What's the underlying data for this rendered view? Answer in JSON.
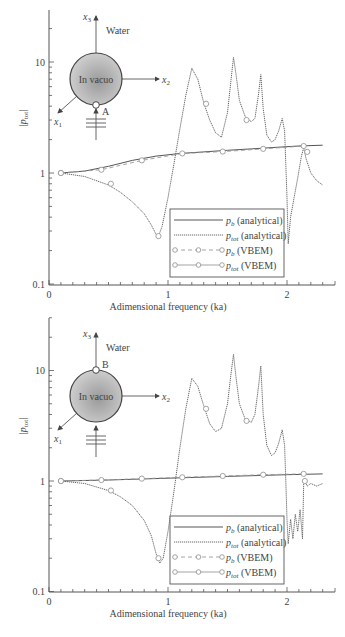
{
  "figure": {
    "panels": [
      {
        "id": "top",
        "inset": {
          "axis_labels": [
            "x3",
            "x2",
            "x1"
          ],
          "medium_label": "Water",
          "sphere_label": "In vacuo",
          "point_label": "A",
          "point_position": "bottom"
        }
      },
      {
        "id": "bottom",
        "inset": {
          "axis_labels": [
            "x3",
            "x2",
            "x1"
          ],
          "medium_label": "Water",
          "sphere_label": "In vacuo",
          "point_label": "B",
          "point_position": "top"
        }
      }
    ]
  },
  "chart_data": [
    {
      "type": "line",
      "title": "",
      "xlabel": "Adimensional frequency (ka)",
      "ylabel": "|p_tot|",
      "yscale": "log",
      "xlim": [
        0,
        2.3
      ],
      "ylim": [
        0.1,
        28
      ],
      "xticks": [
        "0",
        "1",
        "2"
      ],
      "yticks": [
        "0.1",
        "1",
        "10"
      ],
      "legend": {
        "placement": "bottom-right",
        "entries": [
          {
            "label_main": "p",
            "label_sub": "b",
            "label_rest": " (analytical)",
            "style": "solid"
          },
          {
            "label_main": "p",
            "label_sub": "tot",
            "label_rest": " (analytical)",
            "style": "dotted"
          },
          {
            "label_main": "p",
            "label_sub": "b",
            "label_rest": " (VBEM)",
            "style": "dashed-markers"
          },
          {
            "label_main": "p",
            "label_sub": "tot",
            "label_rest": " (VBEM)",
            "style": "solid-markers"
          }
        ]
      },
      "series": [
        {
          "name": "p_b (analytical)",
          "x": [
            0.1,
            0.3,
            0.5,
            0.7,
            0.9,
            1.1,
            1.3,
            1.5,
            1.7,
            1.9,
            2.1,
            2.3
          ],
          "y": [
            1.0,
            1.04,
            1.15,
            1.3,
            1.42,
            1.5,
            1.55,
            1.6,
            1.65,
            1.7,
            1.75,
            1.78
          ]
        },
        {
          "name": "p_tot (analytical)",
          "x": [
            0.1,
            0.3,
            0.5,
            0.6,
            0.7,
            0.8,
            0.86,
            0.9,
            0.92,
            0.95,
            1.0,
            1.05,
            1.1,
            1.15,
            1.2,
            1.25,
            1.3,
            1.35,
            1.4,
            1.45,
            1.5,
            1.53,
            1.55,
            1.57,
            1.6,
            1.65,
            1.7,
            1.73,
            1.76,
            1.78,
            1.8,
            1.83,
            1.87,
            1.9,
            1.93,
            1.96,
            1.98,
            1.99,
            2.0,
            2.01,
            2.03,
            2.06,
            2.09,
            2.12,
            2.14,
            2.16,
            2.2,
            2.25,
            2.3
          ],
          "y": [
            1.0,
            0.93,
            0.78,
            0.67,
            0.55,
            0.43,
            0.34,
            0.28,
            0.27,
            0.33,
            0.6,
            1.2,
            2.5,
            5.0,
            8.8,
            7.0,
            4.3,
            3.0,
            2.3,
            2.1,
            3.5,
            7.0,
            11.0,
            8.0,
            4.5,
            3.2,
            2.9,
            3.1,
            5.0,
            7.7,
            3.8,
            2.2,
            1.9,
            2.0,
            2.4,
            3.1,
            2.4,
            1.2,
            0.6,
            0.23,
            0.4,
            0.6,
            0.9,
            1.4,
            1.7,
            1.35,
            1.0,
            0.85,
            0.78
          ]
        },
        {
          "name": "p_b (VBEM)",
          "x": [
            0.1,
            0.44,
            0.78,
            1.12,
            1.46,
            1.8,
            2.14
          ],
          "y": [
            1.0,
            1.07,
            1.3,
            1.5,
            1.56,
            1.65,
            1.75
          ]
        },
        {
          "name": "p_tot (VBEM)",
          "x": [
            0.1,
            0.52,
            0.92,
            1.32,
            1.66,
            2.17
          ],
          "y": [
            1.0,
            0.8,
            0.27,
            4.2,
            3.0,
            1.55
          ]
        }
      ]
    },
    {
      "type": "line",
      "title": "",
      "xlabel": "Adimensional frequency (ka)",
      "ylabel": "|p_tot|",
      "yscale": "log",
      "xlim": [
        0,
        2.3
      ],
      "ylim": [
        0.1,
        30
      ],
      "xticks": [
        "0",
        "1",
        "2"
      ],
      "yticks": [
        "0.1",
        "1",
        "10"
      ],
      "legend": {
        "placement": "bottom-right",
        "entries": [
          {
            "label_main": "p",
            "label_sub": "b",
            "label_rest": " (analytical)",
            "style": "solid"
          },
          {
            "label_main": "p",
            "label_sub": "tot",
            "label_rest": " (analytical)",
            "style": "dotted"
          },
          {
            "label_main": "p",
            "label_sub": "b",
            "label_rest": " (VBEM)",
            "style": "dashed-markers"
          },
          {
            "label_main": "p",
            "label_sub": "tot",
            "label_rest": " (VBEM)",
            "style": "solid-markers"
          }
        ]
      },
      "series": [
        {
          "name": "p_b (analytical)",
          "x": [
            0.1,
            0.5,
            1.0,
            1.5,
            2.0,
            2.3
          ],
          "y": [
            1.0,
            1.02,
            1.06,
            1.1,
            1.14,
            1.16
          ]
        },
        {
          "name": "p_tot (analytical)",
          "x": [
            0.1,
            0.3,
            0.5,
            0.6,
            0.7,
            0.8,
            0.86,
            0.9,
            0.93,
            0.96,
            1.0,
            1.05,
            1.1,
            1.15,
            1.2,
            1.25,
            1.3,
            1.35,
            1.4,
            1.45,
            1.5,
            1.53,
            1.55,
            1.57,
            1.6,
            1.65,
            1.7,
            1.73,
            1.76,
            1.78,
            1.8,
            1.83,
            1.87,
            1.9,
            1.93,
            1.96,
            1.98,
            1.99,
            2.0,
            2.01,
            2.03,
            2.05,
            2.07,
            2.09,
            2.11,
            2.13,
            2.14,
            2.15,
            2.17,
            2.2,
            2.25,
            2.3
          ],
          "y": [
            1.0,
            0.95,
            0.82,
            0.72,
            0.6,
            0.44,
            0.32,
            0.22,
            0.18,
            0.2,
            0.35,
            0.8,
            2.0,
            4.5,
            8.5,
            7.2,
            4.8,
            3.3,
            2.8,
            3.0,
            5.0,
            9.5,
            14.0,
            9.0,
            5.0,
            3.6,
            3.4,
            4.0,
            7.0,
            11.0,
            4.0,
            2.1,
            1.7,
            1.8,
            2.2,
            2.9,
            2.1,
            1.0,
            0.45,
            0.27,
            0.45,
            0.3,
            0.5,
            0.35,
            0.55,
            0.3,
            0.95,
            1.0,
            0.9,
            0.95,
            0.9,
            0.95
          ]
        },
        {
          "name": "p_b (VBEM)",
          "x": [
            0.1,
            0.44,
            0.78,
            1.12,
            1.46,
            1.8,
            2.14
          ],
          "y": [
            1.0,
            1.02,
            1.05,
            1.08,
            1.11,
            1.14,
            1.16
          ]
        },
        {
          "name": "p_tot (VBEM)",
          "x": [
            0.1,
            0.52,
            0.92,
            1.32,
            1.66,
            2.15
          ],
          "y": [
            1.0,
            0.82,
            0.2,
            4.5,
            3.5,
            1.0
          ]
        }
      ]
    }
  ]
}
